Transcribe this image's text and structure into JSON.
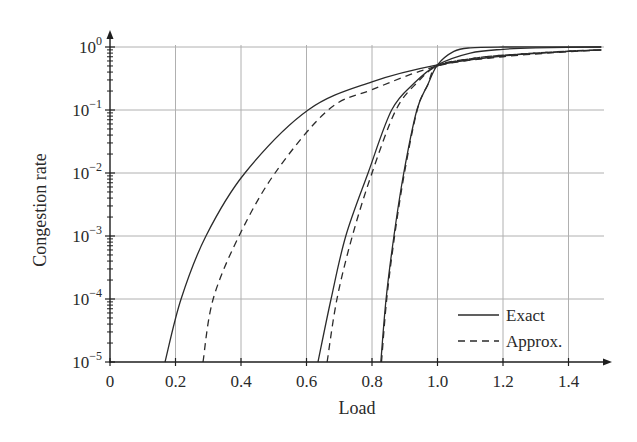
{
  "chart_data": {
    "type": "line",
    "title": "",
    "xlabel": "Load",
    "ylabel": "Congestion rate",
    "xscale": "linear",
    "yscale": "log",
    "xlim": [
      0,
      1.5
    ],
    "ylim": [
      1e-05,
      1.0
    ],
    "grid": true,
    "legend_position": "lower right",
    "x_ticks": [
      0,
      0.2,
      0.4,
      0.6,
      0.8,
      1.0,
      1.2,
      1.4
    ],
    "x_tick_labels": [
      "0",
      "0.2",
      "0.4",
      "0.6",
      "0.8",
      "1.0",
      "1.2",
      "1.4"
    ],
    "y_ticks": [
      1e-05,
      0.0001,
      0.001,
      0.01,
      0.1,
      1
    ],
    "y_tick_labels": [
      {
        "base": "10",
        "exp": "−5"
      },
      {
        "base": "10",
        "exp": "−4"
      },
      {
        "base": "10",
        "exp": "−3"
      },
      {
        "base": "10",
        "exp": "−2"
      },
      {
        "base": "10",
        "exp": "−1"
      },
      {
        "base": "10",
        "exp": "0"
      }
    ],
    "legend": [
      {
        "label": "Exact",
        "style": "solid"
      },
      {
        "label": "Approx.",
        "style": "dashed"
      }
    ],
    "series": [
      {
        "name": "Exact (curve A)",
        "style": "solid",
        "x": [
          0.168,
          0.217,
          0.293,
          0.412,
          0.605,
          0.8,
          1.0,
          1.2,
          1.4,
          1.5
        ],
        "y": [
          1e-05,
          0.0001,
          0.001,
          0.01,
          0.1,
          0.28,
          0.52,
          0.72,
          0.85,
          0.9
        ]
      },
      {
        "name": "Approx. (curve A)",
        "style": "dashed",
        "x": [
          0.284,
          0.315,
          0.394,
          0.504,
          0.666,
          0.8,
          1.0,
          1.2,
          1.4,
          1.5
        ],
        "y": [
          1e-05,
          0.0001,
          0.001,
          0.01,
          0.1,
          0.21,
          0.5,
          0.7,
          0.84,
          0.89
        ]
      },
      {
        "name": "Exact (curve B)",
        "style": "solid",
        "x": [
          0.635,
          0.675,
          0.72,
          0.788,
          0.86,
          0.93,
          1.0,
          1.1,
          1.2,
          1.3,
          1.5
        ],
        "y": [
          1e-05,
          0.0001,
          0.001,
          0.01,
          0.1,
          0.27,
          0.52,
          0.8,
          0.92,
          0.97,
          1.0
        ]
      },
      {
        "name": "Approx. (curve B)",
        "style": "dashed",
        "x": [
          0.663,
          0.693,
          0.74,
          0.8,
          0.873,
          0.94,
          1.0,
          1.1,
          1.2,
          1.4,
          1.5
        ],
        "y": [
          1e-05,
          0.0001,
          0.001,
          0.01,
          0.1,
          0.28,
          0.5,
          0.65,
          0.74,
          0.86,
          0.9
        ]
      },
      {
        "name": "Exact (curve C)",
        "style": "solid",
        "x": [
          0.827,
          0.843,
          0.867,
          0.897,
          0.937,
          0.97,
          1.0,
          1.05,
          1.1,
          1.2,
          1.5
        ],
        "y": [
          1e-05,
          0.0001,
          0.001,
          0.01,
          0.1,
          0.25,
          0.52,
          0.85,
          0.97,
          1.0,
          1.0
        ]
      },
      {
        "name": "Approx. (curve C)",
        "style": "dashed",
        "x": [
          0.829,
          0.845,
          0.869,
          0.899,
          0.938,
          0.97,
          1.0,
          1.1,
          1.2,
          1.4,
          1.5
        ],
        "y": [
          1e-05,
          0.0001,
          0.001,
          0.01,
          0.1,
          0.25,
          0.5,
          0.65,
          0.74,
          0.86,
          0.9
        ]
      }
    ]
  },
  "colors": {
    "line": "#2b2b2b",
    "grid": "#b0b0b0",
    "axis": "#1e1e1e",
    "background": "#ffffff"
  }
}
